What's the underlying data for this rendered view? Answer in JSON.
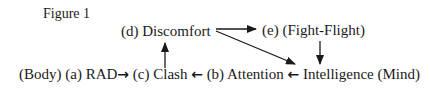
{
  "figure": {
    "title": "Figure 1",
    "nodes": {
      "d": "(d) Discomfort",
      "e": "(e)  (Fight-Flight)"
    },
    "bottom_row": {
      "body": "(Body)",
      "a": "(a) RAD",
      "arrow_right": "→",
      "c": "(c) Clash",
      "arrow_left_1": "←",
      "b": "(b) Attention",
      "arrow_left_2": "←",
      "intelligence": "Intelligence (Mind)"
    },
    "edges": [
      {
        "from": "a",
        "to": "c"
      },
      {
        "from": "c",
        "to": "d"
      },
      {
        "from": "d",
        "to": "e"
      },
      {
        "from": "d",
        "to": "intelligence"
      },
      {
        "from": "e",
        "to": "intelligence"
      },
      {
        "from": "intelligence",
        "to": "b"
      },
      {
        "from": "b",
        "to": "c"
      }
    ]
  }
}
